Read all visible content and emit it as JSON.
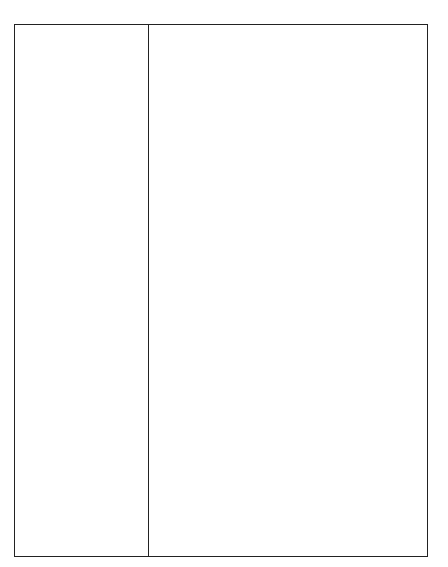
{
  "chart_data": {
    "type": "bar",
    "orientation": "horizontal",
    "title": "",
    "subtitle": "",
    "xlabel": "",
    "ylabel": "",
    "xlim": [
      0,
      100
    ],
    "xtick_labels": [
      "0%",
      "25%",
      "50%",
      "75%",
      "100%"
    ],
    "xtick_values": [
      0,
      25,
      50,
      75,
      100
    ],
    "grid": false,
    "legend": false,
    "value_unit": "%",
    "categories": [
      "Rhodium",
      "Ruthenium",
      "Palladium",
      "Gold",
      "Platinum",
      "Diamond",
      "Vanadium",
      "Chromium",
      "Germanium",
      "Cobalt",
      "Manganese",
      "Beryllium",
      "Uranium",
      "Antimony",
      "Copper",
      "Mercury",
      "Iron  ore",
      "Lead",
      "Nickel",
      "Tantalum",
      "Tungsten",
      "Zinc",
      "Silver",
      "Tin",
      "Aluminum",
      "OPEC oil"
    ],
    "values": [
      64,
      53,
      32,
      58,
      47,
      63,
      67,
      47,
      68,
      60,
      29,
      13,
      41,
      32,
      23,
      6,
      4,
      3,
      5,
      17,
      4,
      6,
      4,
      7,
      4,
      55
    ],
    "series": [
      {
        "name": "Share",
        "values": [
          64,
          53,
          32,
          58,
          47,
          63,
          67,
          47,
          68,
          60,
          29,
          13,
          41,
          32,
          23,
          6,
          4,
          3,
          5,
          17,
          4,
          6,
          4,
          7,
          4,
          55
        ]
      }
    ],
    "bars": [
      {
        "label": "Rhodium",
        "value": 64,
        "style": "hatched"
      },
      {
        "label": "Ruthenium",
        "value": 53,
        "style": "hatched"
      },
      {
        "label": "Palladium",
        "value": 32,
        "style": "hatched"
      },
      {
        "label": "Gold",
        "value": 58,
        "style": "hatched"
      },
      {
        "label": "Platinum",
        "value": 47,
        "style": "hatched"
      },
      {
        "label": "Diamond",
        "value": 63,
        "style": "hatched"
      },
      {
        "label": "Vanadium",
        "value": 67,
        "style": "hatched"
      },
      {
        "label": "Chromium",
        "value": 47,
        "style": "hatched"
      },
      {
        "label": "Germanium",
        "value": 68,
        "style": "hatched"
      },
      {
        "label": "Cobalt",
        "value": 60,
        "style": "hatched"
      },
      {
        "label": "Manganese",
        "value": 29,
        "style": "hatched"
      },
      {
        "label": "Beryllium",
        "value": 13,
        "style": "hatched"
      },
      {
        "label": "Uranium",
        "value": 41,
        "style": "hatched"
      },
      {
        "label": "Antimony",
        "value": 32,
        "style": "hatched"
      },
      {
        "label": "Copper",
        "value": 23,
        "style": "hatched"
      },
      {
        "label": "Mercury",
        "value": 6,
        "style": "hatched"
      },
      {
        "label": "Iron  ore",
        "value": 4,
        "style": "hatched"
      },
      {
        "label": "Lead",
        "value": 3,
        "style": "hatched"
      },
      {
        "label": "Nickel",
        "value": 5,
        "style": "hatched"
      },
      {
        "label": "Tantalum",
        "value": 17,
        "style": "hatched"
      },
      {
        "label": "Tungsten",
        "value": 4,
        "style": "hatched"
      },
      {
        "label": "Zinc",
        "value": 6,
        "style": "hatched"
      },
      {
        "label": "Silver",
        "value": 4,
        "style": "hatched"
      },
      {
        "label": "Tin",
        "value": 7,
        "style": "hatched"
      },
      {
        "label": "Aluminum",
        "value": 4,
        "style": "hatched"
      },
      {
        "label": "OPEC oil",
        "value": 55,
        "style": "stippled-outlined"
      }
    ],
    "colors": {
      "bar_fill": "#8f8f8f",
      "bar_dither_dark": "#5c5c5c",
      "highlight_fill": "#ffffff",
      "highlight_stipple": "#2b2b2b",
      "highlight_outline": "#111111",
      "frame": "#222222",
      "text": "#1c1c1c",
      "background": "#ffffff"
    }
  }
}
